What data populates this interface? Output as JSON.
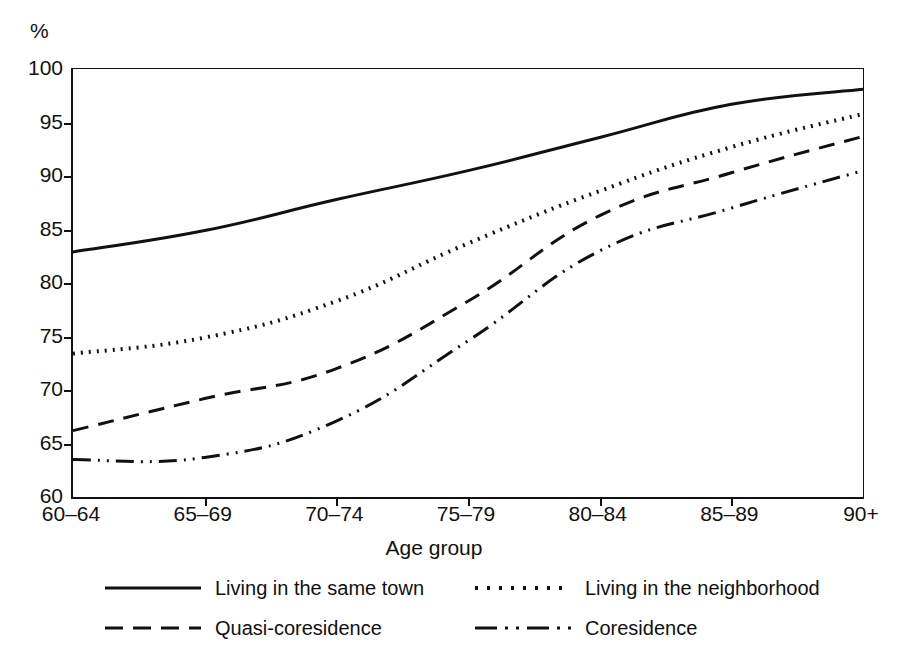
{
  "chart_data": {
    "type": "line",
    "title": "",
    "xlabel": "Age group",
    "ylabel": "%",
    "y_unit_label": "%",
    "categories": [
      "60–64",
      "65–69",
      "70–74",
      "75–79",
      "80–84",
      "85–89",
      "90+"
    ],
    "yticks": [
      60,
      65,
      70,
      75,
      80,
      85,
      90,
      95,
      100
    ],
    "ytick_labels": [
      "60",
      "65",
      "70",
      "75",
      "80",
      "85",
      "90",
      "95",
      "100"
    ],
    "ylim": [
      60,
      100
    ],
    "grid": false,
    "legend_position": "below-axes",
    "series": [
      {
        "name": "Living in the same town",
        "style": "solid",
        "dash": "none",
        "color": "#111111",
        "values": [
          82.9,
          84.9,
          87.8,
          90.5,
          93.6,
          96.7,
          98.1
        ]
      },
      {
        "name": "Living in the neighborhood",
        "style": "dotted",
        "dash": "2,6",
        "color": "#111111",
        "values": [
          73.4,
          74.9,
          78.3,
          83.7,
          88.6,
          92.7,
          95.8
        ]
      },
      {
        "name": "Quasi-coresidence",
        "style": "dashed",
        "dash": "16,10",
        "color": "#111111",
        "values": [
          66.2,
          69.2,
          72.0,
          78.3,
          86.3,
          90.3,
          93.7
        ]
      },
      {
        "name": "Coresidence",
        "style": "dash-dot-dot",
        "dash": "18,7,2,7,2,7",
        "color": "#111111",
        "values": [
          63.5,
          63.7,
          67.1,
          74.6,
          83.0,
          87.0,
          90.5
        ]
      }
    ]
  },
  "legend": {
    "items": [
      {
        "label": "Living in the same town",
        "style": "solid"
      },
      {
        "label": "Living in the neighborhood",
        "style": "dotted"
      },
      {
        "label": "Quasi-coresidence",
        "style": "dashed"
      },
      {
        "label": "Coresidence",
        "style": "dash-dot-dot"
      }
    ]
  },
  "axis": {
    "x_title": "Age group",
    "y_unit": "%"
  }
}
